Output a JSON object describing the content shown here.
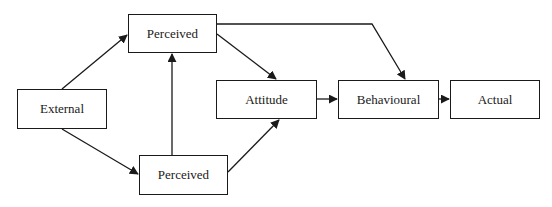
{
  "diagram": {
    "type": "flowchart",
    "nodes": [
      {
        "id": "perceived_top",
        "label": "Perceived",
        "x": 128,
        "y": 14,
        "w": 89,
        "h": 39
      },
      {
        "id": "external",
        "label": "External",
        "x": 17,
        "y": 89,
        "w": 90,
        "h": 40
      },
      {
        "id": "perceived_bottom",
        "label": "Perceived",
        "x": 139,
        "y": 155,
        "w": 89,
        "h": 40
      },
      {
        "id": "attitude",
        "label": "Attitude",
        "x": 216,
        "y": 80,
        "w": 101,
        "h": 39
      },
      {
        "id": "behavioural",
        "label": "Behavioural",
        "x": 338,
        "y": 80,
        "w": 101,
        "h": 39
      },
      {
        "id": "actual",
        "label": "Actual",
        "x": 450,
        "y": 80,
        "w": 90,
        "h": 39
      }
    ],
    "edges": [
      {
        "from": "external",
        "to": "perceived_top"
      },
      {
        "from": "external",
        "to": "perceived_bottom"
      },
      {
        "from": "perceived_bottom",
        "to": "perceived_top"
      },
      {
        "from": "perceived_top",
        "to": "attitude"
      },
      {
        "from": "perceived_bottom",
        "to": "attitude"
      },
      {
        "from": "perceived_top",
        "to": "behavioural"
      },
      {
        "from": "attitude",
        "to": "behavioural"
      },
      {
        "from": "behavioural",
        "to": "actual"
      }
    ],
    "colors": {
      "stroke": "#1a1a1a",
      "background": "#ffffff"
    }
  }
}
